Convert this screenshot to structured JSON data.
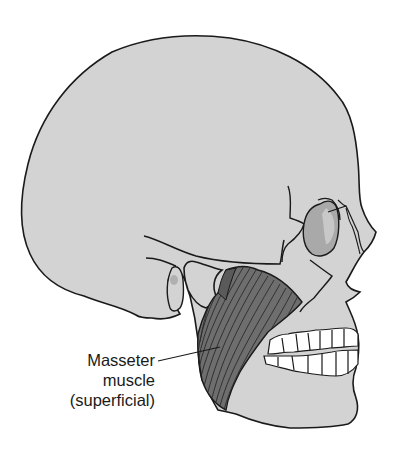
{
  "figure": {
    "colors": {
      "bone": "#d3d3d3",
      "outline": "#1a1a1a",
      "muscle": "#6e6e6e",
      "muscle_fiber": "#2a2a2a",
      "orbit_shade": "#a9a9a9",
      "teeth": "#ffffff",
      "background": "#ffffff"
    }
  },
  "labels": {
    "masseter": {
      "line1": "Masseter",
      "line2": "muscle",
      "line3": "(superficial)"
    }
  }
}
